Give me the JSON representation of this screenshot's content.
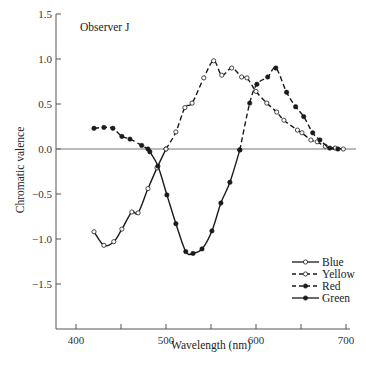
{
  "chart_data": {
    "type": "line",
    "title": "",
    "annotation": "Observer J",
    "xlabel": "Wavelength (nm)",
    "ylabel": "Chromatic valence",
    "xlim": [
      380,
      710
    ],
    "ylim": [
      -2.0,
      1.5
    ],
    "xticks": [
      400,
      450,
      500,
      550,
      600,
      650,
      700
    ],
    "xtick_labels": [
      "400",
      "",
      "500",
      "",
      "600",
      "",
      "700"
    ],
    "yticks": [
      1.5,
      1.0,
      0.5,
      0.0,
      -0.5,
      -1.0,
      -1.5
    ],
    "ytick_labels": [
      "1.5",
      "1.0",
      "0.5",
      "0.0",
      "−0.5",
      "−1.0",
      "−1.5"
    ],
    "zero_line": true,
    "grid": false,
    "legend_position": "lower right",
    "series": [
      {
        "name": "Blue",
        "line_style": "solid",
        "marker": "open-circle",
        "points": [
          [
            420,
            -0.92
          ],
          [
            431,
            -1.07
          ],
          [
            442,
            -1.03
          ],
          [
            451,
            -0.89
          ],
          [
            462,
            -0.7
          ],
          [
            469,
            -0.71
          ],
          [
            480,
            -0.44
          ],
          [
            490,
            -0.21
          ],
          [
            500,
            0.0
          ]
        ]
      },
      {
        "name": "Yellow",
        "line_style": "dashed",
        "marker": "open-circle",
        "points": [
          [
            500,
            0.0
          ],
          [
            511,
            0.19
          ],
          [
            521,
            0.46
          ],
          [
            529,
            0.51
          ],
          [
            542,
            0.79
          ],
          [
            553,
            0.98
          ],
          [
            562,
            0.82
          ],
          [
            573,
            0.9
          ],
          [
            584,
            0.8
          ],
          [
            590,
            0.79
          ],
          [
            600,
            0.64
          ],
          [
            612,
            0.51
          ],
          [
            623,
            0.41
          ],
          [
            631,
            0.32
          ],
          [
            646,
            0.21
          ],
          [
            651,
            0.18
          ],
          [
            661,
            0.1
          ],
          [
            668,
            0.08
          ],
          [
            677,
            0.03
          ],
          [
            688,
            0.01
          ],
          [
            697,
            0.0
          ]
        ]
      },
      {
        "name": "Red",
        "line_style": "dashed",
        "marker": "filled-circle",
        "segments": [
          [
            [
              420,
              0.23
            ],
            [
              431,
              0.24
            ],
            [
              441,
              0.23
            ],
            [
              451,
              0.14
            ],
            [
              460,
              0.11
            ],
            [
              473,
              0.04
            ],
            [
              480,
              0.0
            ]
          ],
          [
            [
              582,
              -0.01
            ],
            [
              593,
              0.51
            ],
            [
              601,
              0.72
            ],
            [
              613,
              0.8
            ],
            [
              622,
              0.9
            ],
            [
              634,
              0.63
            ],
            [
              644,
              0.47
            ],
            [
              653,
              0.36
            ],
            [
              663,
              0.18
            ],
            [
              671,
              0.1
            ],
            [
              682,
              0.01
            ],
            [
              691,
              0.0
            ]
          ]
        ]
      },
      {
        "name": "Green",
        "line_style": "solid",
        "marker": "filled-circle",
        "points": [
          [
            482,
            -0.03
          ],
          [
            491,
            -0.19
          ],
          [
            501,
            -0.51
          ],
          [
            511,
            -0.83
          ],
          [
            522,
            -1.14
          ],
          [
            530,
            -1.16
          ],
          [
            540,
            -1.11
          ],
          [
            551,
            -0.91
          ],
          [
            561,
            -0.6
          ],
          [
            571,
            -0.37
          ],
          [
            582,
            -0.01
          ]
        ]
      }
    ]
  },
  "legend": {
    "items": [
      {
        "label": "Blue"
      },
      {
        "label": "Yellow"
      },
      {
        "label": "Red"
      },
      {
        "label": "Green"
      }
    ]
  },
  "colors": {
    "line": "#1a1a1a",
    "axis": "#555555",
    "zero_line": "#777777"
  }
}
